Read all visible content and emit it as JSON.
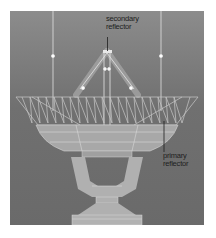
{
  "diagram": {
    "labels": {
      "secondary_line1": "secondary",
      "secondary_line2": "reflector",
      "primary_line1": "primary",
      "primary_line2": "reflector"
    },
    "colors": {
      "background_top": "#8c8c8c",
      "background_bottom": "#6a6a6a",
      "structure": "#b4b4b4",
      "lines": "#d8d8d8",
      "leader": "#1e1e1e"
    }
  }
}
